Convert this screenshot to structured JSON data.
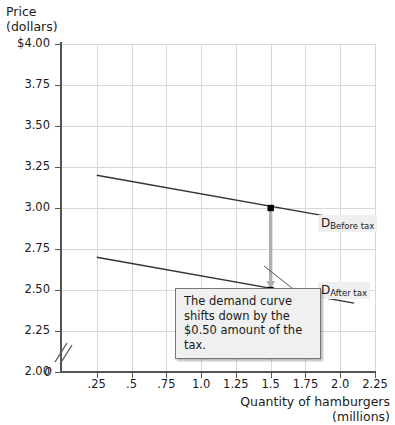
{
  "chart_data": {
    "type": "line",
    "title": "",
    "xlabel": "Quantity of hamburgers\n(millions)",
    "ylabel": "Price\n(dollars)",
    "xlim": [
      0,
      2.25
    ],
    "ylim": [
      2.0,
      4.0
    ],
    "grid": true,
    "legend_position": "inline-right",
    "y_axis_break": true,
    "y_axis_zero_label": "0",
    "yticks": [
      "$4.00",
      "3.75",
      "3.50",
      "3.25",
      "3.00",
      "2.75",
      "2.50",
      "2.25",
      "2.00"
    ],
    "ytick_values": [
      4.0,
      3.75,
      3.5,
      3.25,
      3.0,
      2.75,
      2.5,
      2.25,
      2.0
    ],
    "xticks": [
      ".25",
      ".5",
      ".75",
      "1.0",
      "1.25",
      "1.5",
      "1.75",
      "2.0",
      "2.25"
    ],
    "xtick_values": [
      0.25,
      0.5,
      0.75,
      1.0,
      1.25,
      1.5,
      1.75,
      2.0,
      2.25
    ],
    "series": [
      {
        "name": "D Before tax",
        "label_main": "D",
        "label_sub": "Before tax",
        "x": [
          0.25,
          2.1
        ],
        "values": [
          3.2,
          2.92
        ],
        "color": "#333333"
      },
      {
        "name": "D After tax",
        "label_main": "D",
        "label_sub": "After tax",
        "x": [
          0.25,
          2.1
        ],
        "values": [
          2.7,
          2.42
        ],
        "color": "#333333"
      }
    ],
    "points": [
      {
        "name": "before-tax-point",
        "x": 1.5,
        "y": 3.0
      },
      {
        "name": "after-tax-point",
        "x": 1.5,
        "y": 2.5
      }
    ],
    "shift_arrow": {
      "name": "downward-shift-arrow",
      "x": 1.5,
      "y_from": 3.0,
      "y_to": 2.5,
      "color": "#b0b0b0"
    },
    "annotations": [
      {
        "name": "tax-shift-callout",
        "text": "The demand curve shifts down by the $0.50 amount of the tax.",
        "points_to_x": 1.5,
        "points_to_y": 2.5
      }
    ]
  }
}
